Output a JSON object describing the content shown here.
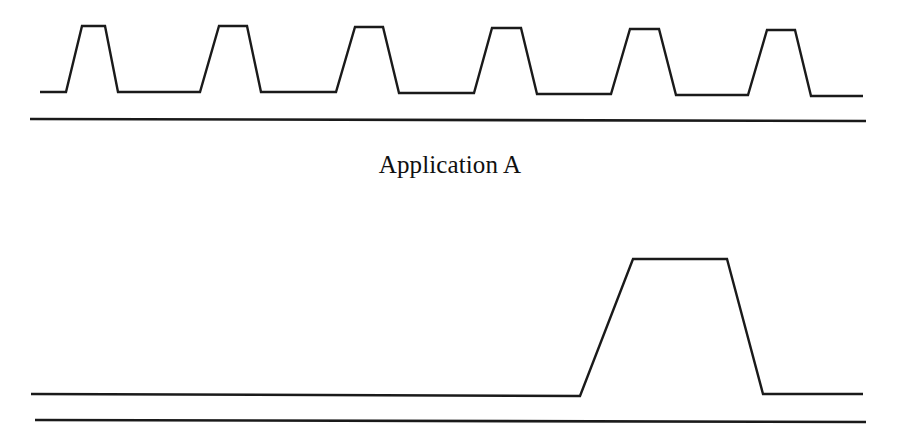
{
  "figure": {
    "width": 900,
    "height": 447,
    "background_color": "#ffffff",
    "stroke_color": "#1a1a1a",
    "caption": "Application A",
    "caption_position": "between-panels"
  },
  "panels": [
    {
      "name": "top-panel",
      "label": "Application A",
      "description": "Periodic square-wave style trace with six regularly spaced trapezoidal pulses of equal height and short duty cycle",
      "baseline_y": 92,
      "peak_y": 26,
      "axis_y": 119,
      "axis_x_start": 30,
      "axis_x_end": 866,
      "pulse_count": 6
    },
    {
      "name": "bottom-panel",
      "label": "",
      "description": "Flat trace with a single wide trapezoidal pulse occurring late in the timeline",
      "baseline_y": 395,
      "peak_y": 259,
      "axis_y": 421,
      "axis_x_start": 35,
      "axis_x_end": 866,
      "pulse_count": 1
    }
  ],
  "chart_data": {
    "type": "line",
    "title": "Application A",
    "xlabel": "",
    "ylabel": "",
    "grid": false,
    "legend": "none",
    "axes_as_baselines": true,
    "series": [
      {
        "name": "top-trace",
        "panel": "top-panel",
        "low_level": 92,
        "high_level": 26,
        "points": [
          [
            40,
            92
          ],
          [
            66,
            92
          ],
          [
            82,
            26
          ],
          [
            105,
            26
          ],
          [
            118,
            92
          ],
          [
            200,
            92
          ],
          [
            219,
            26
          ],
          [
            247,
            26
          ],
          [
            261,
            92
          ],
          [
            336,
            92
          ],
          [
            355,
            27
          ],
          [
            383,
            27
          ],
          [
            399,
            93
          ],
          [
            474,
            93
          ],
          [
            492,
            28
          ],
          [
            521,
            28
          ],
          [
            537,
            94
          ],
          [
            611,
            94
          ],
          [
            630,
            29
          ],
          [
            659,
            29
          ],
          [
            676,
            95
          ],
          [
            748,
            95
          ],
          [
            767,
            30
          ],
          [
            795,
            30
          ],
          [
            811,
            96
          ],
          [
            863,
            96
          ]
        ]
      },
      {
        "name": "bottom-trace",
        "panel": "bottom-panel",
        "low_level": 395,
        "high_level": 259,
        "points": [
          [
            31,
            394
          ],
          [
            580,
            396
          ],
          [
            633,
            259
          ],
          [
            727,
            259
          ],
          [
            763,
            394
          ],
          [
            863,
            394
          ]
        ]
      }
    ],
    "axis_lines": [
      {
        "name": "top-axis",
        "x1": 30,
        "y1": 119,
        "x2": 866,
        "y2": 121
      },
      {
        "name": "bottom-axis",
        "x1": 35,
        "y1": 420,
        "x2": 866,
        "y2": 422
      }
    ]
  }
}
